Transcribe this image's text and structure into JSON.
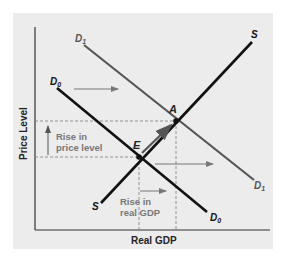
{
  "diagram": {
    "axes": {
      "x_label": "Real GDP",
      "y_label": "Price Level"
    },
    "curves": {
      "d0": {
        "label": "D",
        "sub": "0",
        "color": "#111111"
      },
      "d1": {
        "label": "D",
        "sub": "1",
        "color": "#555555"
      },
      "s": {
        "label": "S",
        "color": "#111111"
      }
    },
    "points": {
      "a": "A",
      "e": "E"
    },
    "annotations": {
      "price_rise_line1": "Rise in",
      "price_rise_line2": "price level",
      "gdp_rise_line1": "Rise in",
      "gdp_rise_line2": "real GDP"
    },
    "colors": {
      "background": "#ececec",
      "dashed": "#888888",
      "arrow": "#777777",
      "label_gray": "#777777"
    }
  }
}
